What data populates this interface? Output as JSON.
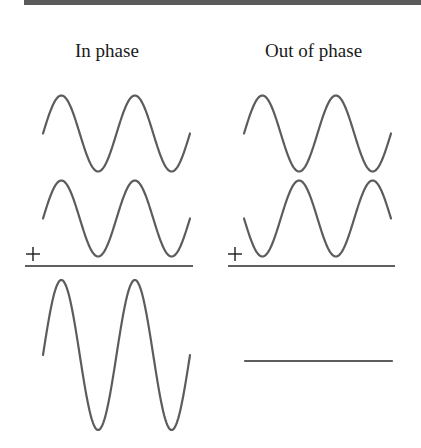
{
  "diagram": {
    "title_bar_color": "#5a5a5a",
    "columns": [
      {
        "label": "In phase",
        "label_pos": {
          "x": 75,
          "y": 40
        },
        "waves": [
          {
            "name": "wave-1",
            "x_start": 43,
            "x_end": 190,
            "midline": 133.5,
            "amplitude": 38,
            "periods": 2,
            "phase": 0.5,
            "invert": false
          },
          {
            "name": "wave-2",
            "x_start": 43,
            "x_end": 190,
            "midline": 218.5,
            "amplitude": 38,
            "periods": 2,
            "phase": 0.5,
            "invert": false
          }
        ],
        "plus": {
          "cx": 33,
          "cy": 254,
          "size": 7
        },
        "rule": {
          "x1": 25,
          "x2": 193,
          "y": 266
        },
        "result": {
          "name": "sum-wave",
          "type": "sine",
          "x_start": 43,
          "x_end": 190,
          "midline": 355,
          "amplitude": 75,
          "periods": 2,
          "phase": 0.5,
          "invert": false
        }
      },
      {
        "label": "Out of phase",
        "label_pos": {
          "x": 265,
          "y": 40
        },
        "waves": [
          {
            "name": "wave-1",
            "x_start": 244,
            "x_end": 391,
            "midline": 133.5,
            "amplitude": 38,
            "periods": 2,
            "phase": 0.5,
            "invert": false
          },
          {
            "name": "wave-2",
            "x_start": 244,
            "x_end": 391,
            "midline": 218.5,
            "amplitude": 38,
            "periods": 2,
            "phase": 0.5,
            "invert": true
          }
        ],
        "plus": {
          "cx": 235,
          "cy": 254,
          "size": 7
        },
        "rule": {
          "x1": 228,
          "x2": 395,
          "y": 266
        },
        "result": {
          "name": "flat-line",
          "type": "flat",
          "x_start": 245,
          "x_end": 392,
          "midline": 361
        }
      }
    ]
  }
}
